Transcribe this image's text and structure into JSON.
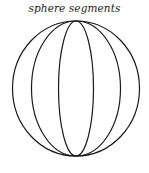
{
  "diagram": {
    "title": "sphere segments",
    "stroke_color": "#1a1a1a",
    "background_color": "#ffffff",
    "sphere": {
      "center": [
        76,
        88.5
      ],
      "rx": 63.5,
      "ry": 67.5
    },
    "meridians": [
      {
        "name": "middle-meridian",
        "rx": 44.5,
        "ry": 67.5
      },
      {
        "name": "inner-meridian",
        "rx": 17.5,
        "ry": 67.5
      }
    ],
    "segment_count": 6
  }
}
